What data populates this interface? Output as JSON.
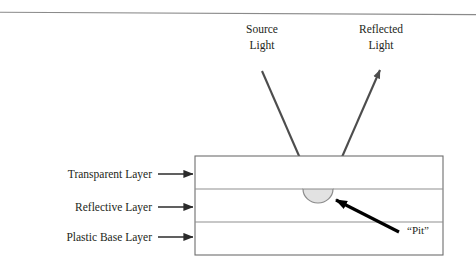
{
  "figure": {
    "top_rule": {
      "name": "header-rule",
      "color": "#8a8a8a"
    },
    "colors": {
      "ink": "#231f20",
      "beam_arrow": "#4d4d4d",
      "pit_arrow": "#000000",
      "box_border": "#6e6e6e",
      "divider": "#8f8f8f",
      "pit_fill": "#e2e2e2",
      "pit_stroke": "#8a8a8a",
      "background": "#ffffff"
    }
  },
  "beams": [
    {
      "id": "source-light",
      "label_line1": "Source",
      "label_line2": "Light",
      "direction": "incoming",
      "arrow_from": [
        262,
        71
      ],
      "arrow_to": [
        313,
        188
      ]
    },
    {
      "id": "reflected-light",
      "label_line1": "Reflected",
      "label_line2": "Light",
      "direction": "outgoing",
      "arrow_from": [
        328,
        188
      ],
      "arrow_to": [
        380,
        70
      ]
    }
  ],
  "layers": [
    {
      "id": "transparent-layer",
      "label": "Transparent Layer",
      "label_x": 152,
      "label_y": 178,
      "arrow_from": [
        158,
        174
      ],
      "arrow_to": [
        193,
        174
      ]
    },
    {
      "id": "reflective-layer",
      "label": "Reflective Layer",
      "label_x": 152,
      "label_y": 211,
      "arrow_from": [
        158,
        207
      ],
      "arrow_to": [
        193,
        207
      ]
    },
    {
      "id": "plastic-base-layer",
      "label": "Plastic Base Layer",
      "label_x": 152,
      "label_y": 241,
      "arrow_from": [
        158,
        237
      ],
      "arrow_to": [
        193,
        237
      ]
    }
  ],
  "disc": {
    "box": {
      "x": 195,
      "y": 156,
      "width": 248,
      "height": 99
    },
    "dividers": [
      189,
      222
    ],
    "pit": {
      "label": "“Pit”",
      "label_x": 407,
      "label_y": 234,
      "center_x": 318,
      "top_y": 189,
      "radius_x": 15,
      "radius_y": 14,
      "arrow_from": [
        399,
        232
      ],
      "arrow_to": [
        334,
        199
      ]
    }
  }
}
